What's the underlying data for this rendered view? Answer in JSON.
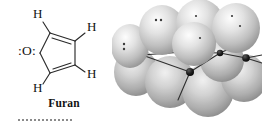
{
  "figure": {
    "kind": "chemistry-illustration",
    "background_color": "#ffffff"
  },
  "left_panel": {
    "name": "furan-lewis-structure",
    "caption": "Furan",
    "oxygen_label": ":O:",
    "hydrogen_labels": [
      "H",
      "H",
      "H",
      "H"
    ],
    "ring_atoms": [
      "O",
      "C",
      "C",
      "C",
      "C"
    ],
    "double_bonds": 2,
    "line_color": "#2a2a2a",
    "text_color": "#111111"
  },
  "right_panel": {
    "name": "furan-p-orbital-model",
    "description": "aromatic pi system orbital lobes",
    "lobe_count": 10,
    "lobe_color_light": "#f2f2f2",
    "lobe_color_mid": "#bdbdbd",
    "lobe_color_dark": "#8e8e8e",
    "atom_node_color": "#1a1a1a",
    "bond_color": "#2f2f2f",
    "lone_pair_dot_color": "#3a3a3a",
    "lone_pair_groups": 4
  }
}
